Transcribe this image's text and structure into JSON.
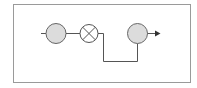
{
  "diagram": {
    "type": "signal-flow block diagram",
    "colors": {
      "border": "#9a9a9a",
      "line": "#555555",
      "node_fill": "#dcdcdc",
      "node_stroke": "#666666",
      "background": "#ffffff"
    },
    "nodes": [
      {
        "id": "node-1",
        "kind": "circle",
        "filled": true,
        "icon": "circle-node-icon"
      },
      {
        "id": "node-2",
        "kind": "multiplier",
        "filled": false,
        "icon": "multiply-node-icon"
      },
      {
        "id": "node-3",
        "kind": "circle",
        "filled": true,
        "icon": "circle-node-icon"
      }
    ],
    "edges": [
      {
        "from": "input",
        "to": "node-1"
      },
      {
        "from": "node-1",
        "to": "node-2"
      },
      {
        "from": "node-2",
        "to": "node-3",
        "routing": "down-right-up"
      },
      {
        "from": "node-3",
        "to": "output",
        "arrow": true
      }
    ]
  }
}
